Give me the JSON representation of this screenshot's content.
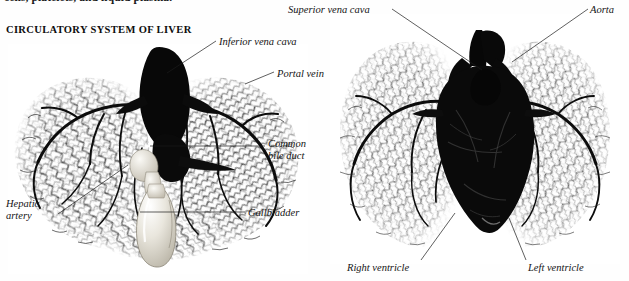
{
  "page": {
    "width": 629,
    "height": 281,
    "background": "#fefefe",
    "ink": "#141414"
  },
  "running_text": {
    "clipped_line": "cells, platelets, and liquid plasma."
  },
  "figure": {
    "title": "CIRCULATORY SYSTEM OF LIVER"
  },
  "left_panel": {
    "name": "liver-vascular-cast",
    "labels": [
      {
        "id": "inferior-vena-cava",
        "text": "Inferior vena cava",
        "x": 219,
        "y": 36,
        "align": "left"
      },
      {
        "id": "portal-vein",
        "text": "Portal vein",
        "x": 277,
        "y": 68,
        "align": "left"
      },
      {
        "id": "common-bile-duct",
        "text": "Common",
        "text2": "bile duct",
        "x": 268,
        "y": 138,
        "align": "left"
      },
      {
        "id": "hepatic-artery",
        "text": "Hepatic",
        "text2": "artery",
        "x": 6,
        "y": 198,
        "align": "left"
      },
      {
        "id": "gallbladder",
        "text": "Gallbladder",
        "x": 248,
        "y": 207,
        "align": "left"
      }
    ],
    "leaders": [
      {
        "id": "leader-inferior-vena-cava",
        "x1": 167,
        "y1": 73,
        "x2": 216,
        "y2": 41
      },
      {
        "id": "leader-portal-vein",
        "x1": 245,
        "y1": 84,
        "x2": 274,
        "y2": 72
      },
      {
        "id": "leader-common-bile-duct",
        "x1": 150,
        "y1": 146,
        "x2": 265,
        "y2": 146
      },
      {
        "id": "leader-hepatic-artery",
        "x1": 58,
        "y1": 214,
        "x2": 128,
        "y2": 165
      },
      {
        "id": "leader-gallbladder",
        "x1": 140,
        "y1": 212,
        "x2": 245,
        "y2": 212
      }
    ]
  },
  "right_panel": {
    "name": "heart-lung-vascular-cast",
    "labels": [
      {
        "id": "superior-vena-cava",
        "text": "Superior vena cava",
        "x": 288,
        "y": 4,
        "align": "left"
      },
      {
        "id": "aorta",
        "text": "Aorta",
        "x": 590,
        "y": 4,
        "align": "left"
      },
      {
        "id": "right-ventricle",
        "text": "Right ventricle",
        "x": 347,
        "y": 262,
        "align": "left"
      },
      {
        "id": "left-ventricle",
        "text": "Left ventricle",
        "x": 528,
        "y": 262,
        "align": "left"
      }
    ],
    "leaders": [
      {
        "id": "leader-superior-vena-cava",
        "x1": 392,
        "y1": 9,
        "x2": 482,
        "y2": 70
      },
      {
        "id": "leader-aorta",
        "x1": 588,
        "y1": 9,
        "x2": 512,
        "y2": 62
      },
      {
        "id": "leader-right-ventricle",
        "x1": 421,
        "y1": 260,
        "x2": 455,
        "y2": 213
      },
      {
        "id": "leader-left-ventricle",
        "x1": 526,
        "y1": 260,
        "x2": 509,
        "y2": 218
      }
    ]
  }
}
